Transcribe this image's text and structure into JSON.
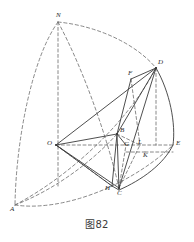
{
  "figure": {
    "caption": "图82",
    "stroke_color": "#3b3b3b",
    "dashed_color": "#6b6b6b",
    "background": "#ffffff",
    "points": [
      {
        "id": "N",
        "label": "N",
        "x": 58,
        "y": 22,
        "lx": 56,
        "ly": 12
      },
      {
        "id": "D",
        "label": "D",
        "x": 156,
        "y": 68,
        "lx": 158,
        "ly": 59
      },
      {
        "id": "F",
        "label": "F",
        "x": 130,
        "y": 79,
        "lx": 128,
        "ly": 70
      },
      {
        "id": "B",
        "label": "B",
        "x": 117,
        "y": 134,
        "lx": 120,
        "ly": 127
      },
      {
        "id": "G",
        "label": "G",
        "x": 126,
        "y": 145,
        "lx": 124,
        "ly": 141
      },
      {
        "id": "L",
        "label": "L",
        "x": 140,
        "y": 145,
        "lx": 138,
        "ly": 140
      },
      {
        "id": "K",
        "label": "K",
        "x": 145,
        "y": 145,
        "lx": 143,
        "ly": 150
      },
      {
        "id": "E",
        "label": "E",
        "x": 173,
        "y": 145,
        "lx": 176,
        "ly": 141
      },
      {
        "id": "O",
        "label": "O",
        "x": 56,
        "y": 145,
        "lx": 48,
        "ly": 141
      },
      {
        "id": "H",
        "label": "H",
        "x": 112,
        "y": 186,
        "lx": 106,
        "ly": 186
      },
      {
        "id": "C",
        "label": "C",
        "x": 119,
        "y": 188,
        "lx": 118,
        "ly": 190
      },
      {
        "id": "A",
        "label": "A",
        "x": 15,
        "y": 205,
        "lx": 11,
        "ly": 206
      }
    ]
  }
}
